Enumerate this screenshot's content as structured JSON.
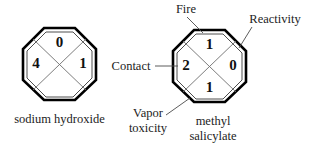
{
  "figure": {
    "title_visible": false,
    "background_color": "#ffffff",
    "ink_color": "#111111"
  },
  "diagrams": [
    {
      "id": "sodium-hydroxide",
      "caption": "sodium hydroxide",
      "caption_lines": [
        "sodium hydroxide"
      ],
      "shape": "octagon",
      "quadrants": {
        "top": "0",
        "left": "4",
        "right": "1",
        "bottom": ""
      },
      "callouts": []
    },
    {
      "id": "methyl-salicylate",
      "caption": "methyl salicylate",
      "caption_lines": [
        "methyl",
        "salicylate"
      ],
      "shape": "octagon",
      "quadrants": {
        "top": "1",
        "left": "2",
        "right": "0",
        "bottom": "1"
      },
      "callouts": [
        {
          "id": "fire",
          "label": "Fire",
          "label_lines": [
            "Fire"
          ],
          "points_to": "top"
        },
        {
          "id": "reactivity",
          "label": "Reactivity",
          "label_lines": [
            "Reactivity"
          ],
          "points_to": "right"
        },
        {
          "id": "contact",
          "label": "Contact",
          "label_lines": [
            "Contact"
          ],
          "points_to": "left"
        },
        {
          "id": "vapor-toxicity",
          "label": "Vapor toxicity",
          "label_lines": [
            "Vapor",
            "toxicity"
          ],
          "points_to": "bottom"
        }
      ]
    }
  ],
  "text": {
    "fire": "Fire",
    "reactivity": "Reactivity",
    "contact": "Contact",
    "vapor_line1": "Vapor",
    "vapor_line2": "toxicity",
    "methyl_line1": "methyl",
    "methyl_line2": "salicylate",
    "sodium_hydroxide": "sodium hydroxide",
    "naoh_top": "0",
    "naoh_left": "4",
    "naoh_right": "1",
    "naoh_bottom": "",
    "ms_top": "1",
    "ms_left": "2",
    "ms_right": "0",
    "ms_bottom": "1"
  }
}
